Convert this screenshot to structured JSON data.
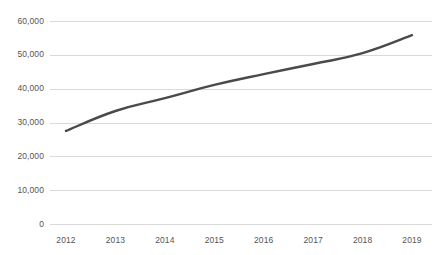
{
  "chart_data": {
    "type": "line",
    "title": "",
    "subtitle": "",
    "xlabel": "",
    "ylabel": "",
    "categories": [
      "2012",
      "2013",
      "2014",
      "2015",
      "2016",
      "2017",
      "2018",
      "2019"
    ],
    "values": [
      27500,
      33400,
      37200,
      41100,
      44300,
      47300,
      50500,
      55800
    ],
    "series": [
      {
        "name": "",
        "values": [
          27500,
          33400,
          37200,
          41100,
          44300,
          47300,
          50500,
          55800
        ]
      }
    ],
    "ylim": [
      0,
      60000
    ],
    "yticks": [
      0,
      10000,
      20000,
      30000,
      40000,
      50000,
      60000
    ],
    "ytick_labels": [
      "0",
      "10,000",
      "20,000",
      "30,000",
      "40,000",
      "50,000",
      "60,000"
    ],
    "xtick_labels": [
      "2012",
      "2013",
      "2014",
      "2015",
      "2016",
      "2017",
      "2018",
      "2019"
    ],
    "grid": "horizontal",
    "legend": "none",
    "colors": {
      "line": "#4a4a4a",
      "gridline": "#d9d9d9",
      "tick_text": "#555555",
      "background": "#ffffff"
    },
    "line_width": 2.4
  }
}
